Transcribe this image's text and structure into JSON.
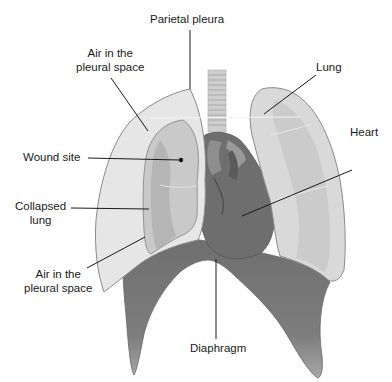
{
  "diagram": {
    "colors": {
      "background": "#ffffff",
      "pleural_air": "#e6e6e6",
      "lung_light": "#d9d9d9",
      "lung_mid": "#c2c2c2",
      "collapsed_lung": "#b5b5b5",
      "heart": "#6e6e6e",
      "diaphragm": "#7a7a7a",
      "trachea": "#cfcfcf",
      "outline": "#8a8a8a",
      "leader_line": "#1a1a1a"
    },
    "labels": {
      "parietal_pleura": "Parietal pleura",
      "air_pleural_top_line1": "Air in the",
      "air_pleural_top_line2": "pleural space",
      "lung": "Lung",
      "heart": "Heart",
      "wound_site": "Wound site",
      "collapsed_lung_line1": "Collapsed",
      "collapsed_lung_line2": "lung",
      "air_pleural_bottom_line1": "Air in the",
      "air_pleural_bottom_line2": "pleural space",
      "diaphragm": "Diaphragm"
    }
  }
}
